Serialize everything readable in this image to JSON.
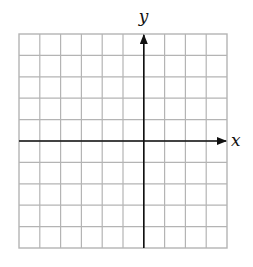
{
  "diagram": {
    "type": "coordinate-grid",
    "grid": {
      "columns": 10,
      "rows": 10,
      "columns_left_of_y_axis": 6,
      "columns_right_of_y_axis": 4,
      "rows_above_x_axis": 5,
      "rows_below_x_axis": 5,
      "left": 19,
      "top": 34,
      "right": 227,
      "bottom": 248,
      "line_color": "#b4b4b4"
    },
    "axes": {
      "color": "#111111",
      "x_label": "x",
      "y_label": "y",
      "origin": {
        "x": 143.8,
        "y": 141
      }
    }
  }
}
